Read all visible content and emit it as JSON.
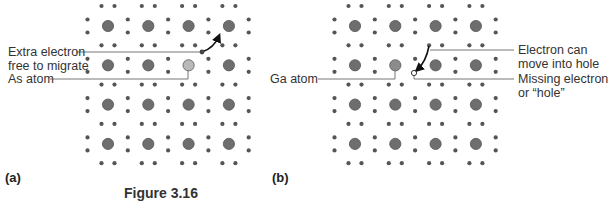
{
  "figure": {
    "caption_partial": "Figure 3.16",
    "colors": {
      "atom": "#6e6e6e",
      "atom_stroke": "#555555",
      "dopant_as": "#b9b9b9",
      "dopant_ga": "#8c8c8c",
      "electron": "#555555",
      "leader_line": "#777777",
      "hole_fill": "#ffffff"
    }
  },
  "panels": [
    {
      "id": "a",
      "label": "(a)",
      "description": "n-type: Arsenic donor atom in silicon lattice",
      "annotations": [
        {
          "text_lines": [
            "Extra electron",
            "free to migrate"
          ],
          "target": "extra-electron"
        },
        {
          "text_lines": [
            "As atom"
          ],
          "target": "as-dopant-atom"
        }
      ],
      "grid": {
        "rows": 4,
        "cols": 4,
        "dopant_position": [
          1,
          2
        ]
      }
    },
    {
      "id": "b",
      "label": "(b)",
      "description": "p-type: Gallium acceptor atom in silicon lattice",
      "annotations": [
        {
          "text_lines": [
            "Ga atom"
          ],
          "target": "ga-dopant-atom"
        },
        {
          "text_lines": [
            "Electron can",
            "move into hole"
          ],
          "target": "migrating-electron"
        },
        {
          "text_lines": [
            "Missing electron",
            "or “hole”"
          ],
          "target": "hole"
        }
      ],
      "grid": {
        "rows": 4,
        "cols": 4,
        "dopant_position": [
          1,
          1
        ]
      }
    }
  ],
  "labels": {
    "a_extra_1": "Extra electron",
    "a_extra_2": "free to migrate",
    "a_as": "As atom",
    "b_ga": "Ga atom",
    "b_elec_1": "Electron can",
    "b_elec_2": "move into hole",
    "b_hole_1": "Missing electron",
    "b_hole_2": "or “hole”",
    "panel_a": "(a)",
    "panel_b": "(b)",
    "caption": "Figure 3.16"
  }
}
